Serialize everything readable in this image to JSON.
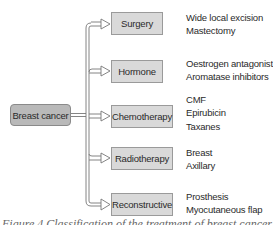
{
  "diagram": {
    "root": {
      "label": "Breast cancer"
    },
    "categories": [
      {
        "label": "Surgery",
        "items": [
          "Wide local excision",
          "Mastectomy"
        ]
      },
      {
        "label": "Hormone",
        "items": [
          "Oestrogen antagonist",
          "Aromatase inhibitors"
        ]
      },
      {
        "label": "Chemotherapy",
        "items": [
          "CMF",
          "Epirubicin",
          "Taxanes"
        ]
      },
      {
        "label": "Radiotherapy",
        "items": [
          "Breast",
          "Axillary"
        ]
      },
      {
        "label": "Reconstructive",
        "items": [
          "Prosthesis",
          "Myocutaneous flap"
        ]
      }
    ],
    "caption": "Figure 4 Classification of the treatment of breast cancer"
  },
  "colors": {
    "root_fill": "#b9b9b9",
    "box_fill": "#d9d9d9",
    "line": "#777777",
    "text": "#2a2a2a"
  }
}
